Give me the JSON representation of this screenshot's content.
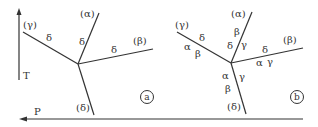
{
  "axes": {
    "t_label": "T",
    "p_label": "P"
  },
  "panel_a": {
    "badge": "a",
    "phases": {
      "gamma": "(γ)",
      "alpha": "(α)",
      "beta": "(β)",
      "delta": "(δ)"
    },
    "line_labels": {
      "gamma_line": "δ",
      "alpha_line": "δ",
      "beta_line": "δ"
    }
  },
  "panel_b": {
    "badge": "b",
    "phases": {
      "gamma": "(γ)",
      "alpha": "(α)",
      "beta": "(β)",
      "delta": "(δ)"
    },
    "line_labels": {
      "gamma_top": "δ",
      "gamma_bot_1": "α",
      "gamma_bot_2": "β",
      "alpha_left_1": "β",
      "alpha_left_2": "δ",
      "alpha_right": "γ",
      "beta_top": "δ",
      "beta_bot_1": "α",
      "beta_bot_2": "γ",
      "delta_left_1": "α",
      "delta_left_2": "β",
      "delta_right": "γ"
    }
  },
  "colors": {
    "line": "#333333",
    "background": "#ffffff"
  }
}
